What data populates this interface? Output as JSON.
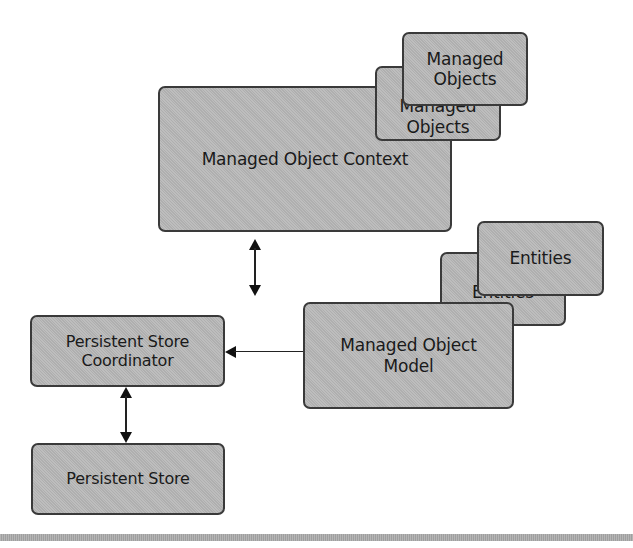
{
  "diagram": {
    "nodes": {
      "managed_object_context": {
        "label": "Managed Object Context"
      },
      "managed_objects_back": {
        "line1": "Managed",
        "line2": "Objects"
      },
      "managed_objects_front": {
        "line1": "Managed",
        "line2": "Objects"
      },
      "persistent_store_coordinator": {
        "line1": "Persistent Store",
        "line2": "Coordinator"
      },
      "managed_object_model": {
        "line1": "Managed Object",
        "line2": "Model"
      },
      "entities_back": {
        "label": "Entities"
      },
      "entities_front": {
        "label": "Entities"
      },
      "persistent_store": {
        "label": "Persistent Store"
      }
    },
    "edges": [
      {
        "from": "managed_object_context",
        "to": "persistent_store_coordinator",
        "direction": "bidirectional"
      },
      {
        "from": "managed_object_model",
        "to": "persistent_store_coordinator",
        "direction": "one-way"
      },
      {
        "from": "persistent_store_coordinator",
        "to": "persistent_store",
        "direction": "bidirectional"
      }
    ],
    "colors": {
      "box_fill": "#b8b8b8",
      "box_border": "#3a3a3a",
      "arrow": "#111111",
      "rule": "#a9a9a9"
    }
  }
}
